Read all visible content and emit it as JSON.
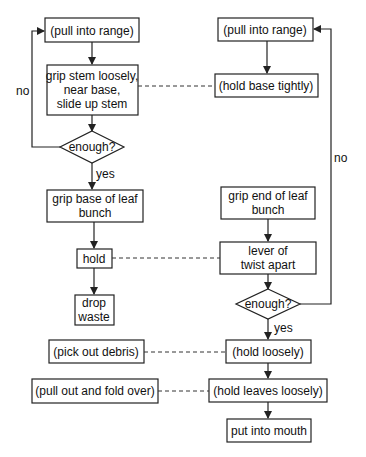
{
  "diagram": {
    "left": {
      "pull_into_range": "(pull into range)",
      "grip_stem": [
        "grip stem loosely,",
        "near base,",
        "slide up stem"
      ],
      "enough": "enough?",
      "no_label": "no",
      "yes_label": "yes",
      "grip_base": [
        "grip base of leaf",
        "bunch"
      ],
      "hold": "hold",
      "drop_waste": [
        "drop",
        "waste"
      ]
    },
    "right": {
      "pull_into_range": "(pull into range)",
      "hold_base_tightly": "(hold base tightly)",
      "no_label": "no",
      "grip_end": [
        "grip end of leaf",
        "bunch"
      ],
      "lever_twist": [
        "lever of",
        "twist apart"
      ],
      "enough": "enough?",
      "yes_label": "yes",
      "hold_loosely": "(hold loosely)",
      "hold_leaves_loosely": "(hold leaves loosely)",
      "put_into_mouth": "put into mouth"
    },
    "side": {
      "pick_out_debris": "(pick out debris)",
      "pull_out_fold_over": "(pull out and fold over)"
    }
  }
}
